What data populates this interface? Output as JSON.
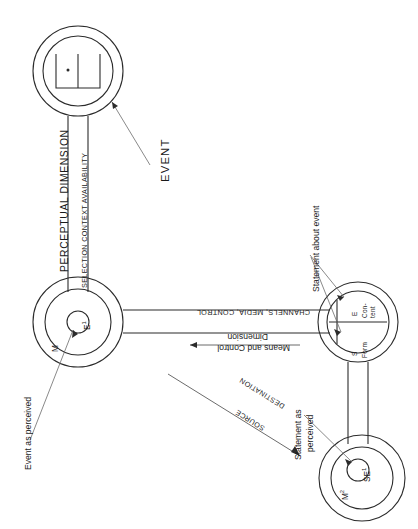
{
  "figure": {
    "domain": "diagram",
    "type": "communication-model-schematic",
    "orientation": "page rotated 90 degrees (landscape scan of a portrait figure)",
    "background_color": "#ffffff",
    "line_color": "#2b2b2b"
  },
  "nodes": {
    "event": {
      "id": "event-node",
      "inner_symbol": "E",
      "description": "double circle containing open-top square with centre dot",
      "callout_label": "EVENT"
    },
    "observer": {
      "id": "observer-node",
      "core_label": "E",
      "core_superscript": "1",
      "ring_label": "M",
      "callout_label": "Event as perceived"
    },
    "message": {
      "id": "message-node",
      "upper_tag": "E",
      "upper_label": "Con-\ntent",
      "upper_label_line1": "E",
      "upper_label_line2": "Con-",
      "upper_label_line3": "tent",
      "lower_label_line1": "S",
      "lower_label_line2": "Form",
      "callout_label": "Statement about event"
    },
    "receiver": {
      "id": "receiver-node",
      "core_label": "SE",
      "core_superscript": "1",
      "ring_label": "M",
      "ring_superscript": "2",
      "callout_line1": "Statement as",
      "callout_line2": "perceived"
    }
  },
  "channels": {
    "perception_channel": {
      "outer_label": "PERCEPTUAL DIMENSION",
      "inner_label": "SELECTION CONTEXT AVAILABILITY"
    },
    "transmission_channel": {
      "outer_label": "CHANNELS, MEDIA, CONTROL",
      "inner_label_line1": "Means and Control",
      "inner_label_line2": "Dimension"
    }
  },
  "arrows": {
    "source_destination": {
      "source_label": "SOURCE",
      "destination_label": "DESTINATION"
    }
  },
  "callouts": [
    {
      "name": "event-callout",
      "text": "EVENT"
    },
    {
      "name": "event-as-perceived-callout",
      "text": "Event as perceived"
    },
    {
      "name": "statement-about-event-callout",
      "text": "Statement about event"
    },
    {
      "name": "statement-as-perceived-callout",
      "text": "Statement as perceived"
    }
  ]
}
